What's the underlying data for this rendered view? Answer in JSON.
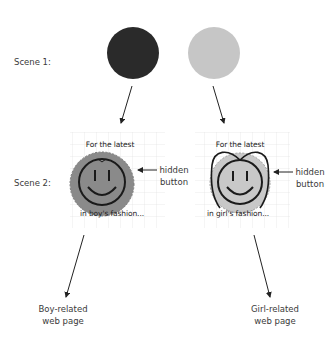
{
  "scene1": {
    "label": "Scene 1:",
    "boy_circle_color": "#2a2a2a",
    "girl_circle_color": "#c6c6c6"
  },
  "scene2": {
    "label": "Scene 2:",
    "boy_banner": {
      "top_text": "For the latest",
      "bottom_text": "in boy's fashion...",
      "face_color": "#8a8a8a",
      "icon": "smiley-face-icon"
    },
    "girl_banner": {
      "top_text": "For the latest",
      "bottom_text": "in girl's fashion...",
      "face_color": "#c8c8c8",
      "icon": "smiley-face-with-bow-icon"
    },
    "hidden_button_label_line1": "hidden",
    "hidden_button_label_line2": "button"
  },
  "outcomes": {
    "boy_line1": "Boy-related",
    "boy_line2": "web page",
    "girl_line1": "Girl-related",
    "girl_line2": "web page"
  }
}
